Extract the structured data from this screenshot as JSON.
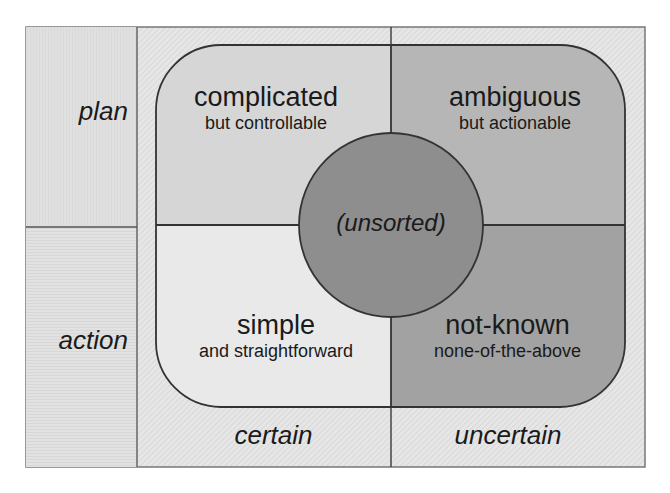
{
  "diagram": {
    "row_labels": [
      "plan",
      "action"
    ],
    "column_labels": [
      "certain",
      "uncertain"
    ],
    "quadrants": [
      {
        "id": "top-left",
        "title": "complicated",
        "subtitle": "but controllable",
        "fill": "#d4d4d4"
      },
      {
        "id": "top-right",
        "title": "ambiguous",
        "subtitle": "but actionable",
        "fill": "#b4b4b4"
      },
      {
        "id": "bottom-left",
        "title": "simple",
        "subtitle": "and straightforward",
        "fill": "#e8e8e8"
      },
      {
        "id": "bottom-right",
        "title": "not-known",
        "subtitle": "none-of-the-above",
        "fill": "#a0a0a0"
      }
    ],
    "center": {
      "label": "(unsorted)",
      "fill": "#8c8c8c"
    },
    "colors": {
      "frame_bg": "#e4e4e4",
      "left_col_bg": "#dedede",
      "line": "#333333",
      "frame_line": "#777777"
    }
  }
}
